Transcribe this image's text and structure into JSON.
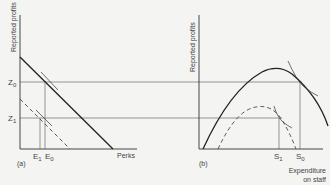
{
  "panel_a": {
    "label": "(a)",
    "y_axis_label": "Reported profits",
    "x_axis_label": "Perks",
    "y_ticks": [
      {
        "label": "Z",
        "sub": "0"
      },
      {
        "label": "Z",
        "sub": "1"
      }
    ],
    "x_ticks": [
      {
        "label": "E",
        "sub": "1"
      },
      {
        "label": "E",
        "sub": "0"
      }
    ],
    "lines": [
      {
        "name": "budget-line-solid",
        "style": "solid"
      },
      {
        "name": "budget-line-dashed",
        "style": "dashed"
      }
    ]
  },
  "panel_b": {
    "label": "(b)",
    "y_axis_label": "Reported profits",
    "x_axis_label_line1": "Expenditure",
    "x_axis_label_line2": "on staff",
    "x_ticks": [
      {
        "label": "S",
        "sub": "1"
      },
      {
        "label": "S",
        "sub": "0"
      }
    ],
    "curves": [
      {
        "name": "profit-curve-solid",
        "style": "solid"
      },
      {
        "name": "profit-curve-dashed",
        "style": "dashed"
      }
    ]
  }
}
